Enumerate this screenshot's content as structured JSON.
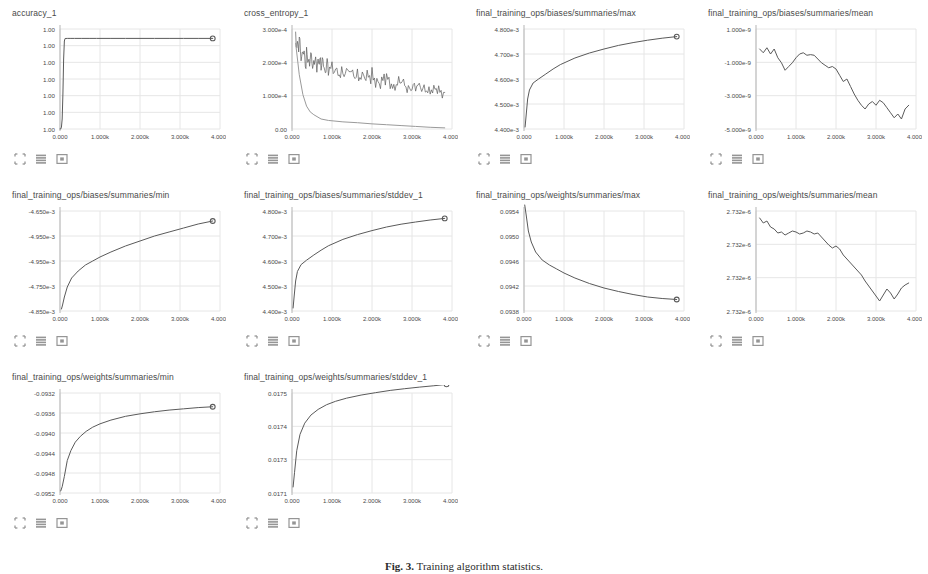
{
  "page": {
    "app": "TensorBoard Scalars Dashboard",
    "caption_label": "Fig. 3.",
    "caption_text": "Training algorithm statistics."
  },
  "toolbar": {
    "icons": [
      {
        "name": "expand-axes-icon",
        "label": "Fit domain to data"
      },
      {
        "name": "data-table-icon",
        "label": "Toggle data table"
      },
      {
        "name": "fullscreen-icon",
        "label": "Expand chart"
      }
    ]
  },
  "chart_data": [
    {
      "type": "line",
      "title": "accuracy_1",
      "xlabel": "",
      "ylabel": "",
      "grid": true,
      "legend": false,
      "xticks": [
        "0.000",
        "1.000k",
        "2.000k",
        "3.000k",
        "4.000k"
      ],
      "yticks": [
        "1.00",
        "1.00",
        "1.00",
        "1.00",
        "1.00",
        "1.00",
        "1.00"
      ],
      "xlim": [
        0,
        4400
      ],
      "ylim": [
        0,
        1
      ],
      "x": [
        0,
        20,
        40,
        60,
        80,
        100,
        120,
        140,
        200,
        300,
        400,
        600,
        800,
        1000,
        1400,
        1800,
        2200,
        2600,
        3000,
        3400,
        3800,
        4200
      ],
      "values": [
        0.0,
        0.0,
        0.02,
        0.1,
        0.35,
        0.7,
        0.88,
        0.905,
        0.906,
        0.906,
        0.906,
        0.906,
        0.906,
        0.906,
        0.906,
        0.906,
        0.906,
        0.906,
        0.906,
        0.906,
        0.906,
        0.906
      ],
      "endpoint_marker": true
    },
    {
      "type": "line",
      "title": "cross_entropy_1",
      "xlabel": "",
      "ylabel": "",
      "grid": true,
      "legend": false,
      "xticks": [
        "0.000",
        "1.000k",
        "2.000k",
        "3.000k",
        "4.000k"
      ],
      "yticks": [
        "3.000e-4",
        "2.000e-4",
        "1.000e-4",
        "0.00"
      ],
      "xlim": [
        0,
        4400
      ],
      "ylim": [
        0,
        0.00035
      ],
      "series": [
        {
          "name": "train",
          "x": [
            100,
            200,
            300,
            400,
            500,
            600,
            700,
            800,
            900,
            1000,
            1200,
            1400,
            1600,
            1800,
            2000,
            2200,
            2400,
            2600,
            2800,
            3000,
            3200,
            3400,
            3600,
            3800,
            4000,
            4200
          ],
          "values": [
            0.00033,
            0.0003,
            0.000265,
            0.000245,
            0.000235,
            0.000225,
            0.000215,
            0.000228,
            0.000205,
            0.000215,
            0.000195,
            0.000205,
            0.000188,
            0.000195,
            0.000175,
            0.000185,
            0.000162,
            0.000172,
            0.000155,
            0.000162,
            0.000145,
            0.000152,
            0.000138,
            0.000142,
            0.00013,
            0.000128
          ],
          "noisy": true
        },
        {
          "name": "test",
          "x": [
            100,
            200,
            300,
            400,
            500,
            600,
            800,
            1000,
            1400,
            1800,
            2200,
            2600,
            3000,
            3400,
            3800,
            4200
          ],
          "values": [
            0.0003,
            0.00019,
            0.00012,
            8e-05,
            6e-05,
            5e-05,
            3.5e-05,
            3e-05,
            2.5e-05,
            2.2e-05,
            1.8e-05,
            1.5e-05,
            1.2e-05,
            9e-06,
            6e-06,
            4e-06
          ],
          "noisy": false
        }
      ]
    },
    {
      "type": "line",
      "title": "final_training_ops/biases/summaries/max",
      "xlabel": "",
      "ylabel": "",
      "grid": true,
      "legend": false,
      "xticks": [
        "0.000",
        "1.000k",
        "2.000k",
        "3.000k",
        "4.000k"
      ],
      "yticks": [
        "4.800e-3",
        "4.700e-3",
        "4.600e-3",
        "4.500e-3",
        "4.400e-3"
      ],
      "xlim": [
        0,
        4400
      ],
      "ylim": [
        0.00435,
        0.00485
      ],
      "x": [
        30,
        60,
        100,
        150,
        250,
        400,
        600,
        800,
        1000,
        1400,
        1800,
        2200,
        2600,
        3000,
        3400,
        3800,
        4200
      ],
      "values": [
        0.00436,
        0.00442,
        0.0045,
        0.004545,
        0.00458,
        0.0046,
        0.004625,
        0.00465,
        0.004672,
        0.004705,
        0.00473,
        0.00475,
        0.004768,
        0.004782,
        0.004794,
        0.004804,
        0.004812
      ],
      "endpoint_marker": true
    },
    {
      "type": "line",
      "title": "final_training_ops/biases/summaries/mean",
      "xlabel": "",
      "ylabel": "",
      "grid": true,
      "legend": false,
      "xticks": [
        "0.000",
        "1.000k",
        "2.000k",
        "3.000k",
        "4.000k"
      ],
      "yticks": [
        "1.000e-9",
        "-1.000e-9",
        "-3.000e-9",
        "-5.000e-9"
      ],
      "xlim": [
        0,
        4400
      ],
      "ylim": [
        -6.2e-09,
        1.8e-09
      ],
      "x": [
        100,
        200,
        300,
        400,
        500,
        600,
        700,
        800,
        900,
        1000,
        1100,
        1200,
        1300,
        1400,
        1500,
        1600,
        1700,
        1800,
        1900,
        2000,
        2100,
        2200,
        2300,
        2400,
        2500,
        2600,
        2700,
        2800,
        2900,
        3000,
        3100,
        3200,
        3300,
        3400,
        3500,
        3600,
        3700,
        3800,
        3900,
        4000,
        4100,
        4200
      ],
      "values": [
        2e-10,
        -1e-10,
        3e-10,
        -2e-10,
        2e-10,
        -5e-10,
        -9e-10,
        -1.5e-09,
        -1.2e-09,
        -9e-10,
        -5e-10,
        -2e-10,
        -1e-10,
        -3e-10,
        -2.5e-10,
        -3e-10,
        -6e-10,
        -9e-10,
        -1.1e-09,
        -1.3e-09,
        -1.2e-09,
        -1.4e-09,
        -1.9e-09,
        -2.4e-09,
        -2.2e-09,
        -2.8e-09,
        -3.4e-09,
        -3.9e-09,
        -4.3e-09,
        -4.6e-09,
        -4.2e-09,
        -4e-09,
        -4.3e-09,
        -3.9e-09,
        -4.1e-09,
        -4.5e-09,
        -4.9e-09,
        -5.3e-09,
        -5e-09,
        -5.4e-09,
        -4.6e-09,
        -4.3e-09
      ]
    },
    {
      "type": "line",
      "title": "final_training_ops/biases/summaries/min",
      "xlabel": "",
      "ylabel": "",
      "grid": true,
      "legend": false,
      "xticks": [
        "0.000",
        "1.000k",
        "2.000k",
        "3.000k",
        "4.000k"
      ],
      "yticks": [
        "-4.650e-3",
        "-4.950e-3",
        "-4.950e-3",
        "-4.750e-3",
        "-4.850e-3"
      ],
      "xlim": [
        0,
        4400
      ],
      "ylim": [
        0,
        1
      ],
      "x": [
        40,
        70,
        120,
        200,
        320,
        500,
        700,
        900,
        1100,
        1400,
        1800,
        2200,
        2600,
        3000,
        3400,
        3800,
        4200
      ],
      "values": [
        0.02,
        0.06,
        0.14,
        0.24,
        0.33,
        0.4,
        0.46,
        0.5,
        0.54,
        0.59,
        0.65,
        0.7,
        0.75,
        0.79,
        0.83,
        0.87,
        0.9
      ],
      "endpoint_marker": true
    },
    {
      "type": "line",
      "title": "final_training_ops/biases/summaries/stddev_1",
      "xlabel": "",
      "ylabel": "",
      "grid": true,
      "legend": false,
      "xticks": [
        "0.000",
        "1.000k",
        "2.000k",
        "3.000k",
        "4.000k"
      ],
      "yticks": [
        "4.800e-3",
        "4.700e-3",
        "4.600e-3",
        "4.500e-3",
        "4.400e-3"
      ],
      "xlim": [
        0,
        4400
      ],
      "ylim": [
        0.00435,
        0.00485
      ],
      "x": [
        30,
        60,
        100,
        150,
        250,
        400,
        600,
        800,
        1000,
        1400,
        1800,
        2200,
        2600,
        3000,
        3400,
        3800,
        4200
      ],
      "values": [
        0.004365,
        0.004425,
        0.0045,
        0.004548,
        0.004582,
        0.004604,
        0.00463,
        0.004654,
        0.004676,
        0.004708,
        0.004732,
        0.004752,
        0.00477,
        0.004784,
        0.004795,
        0.004805,
        0.004813
      ],
      "endpoint_marker": true
    },
    {
      "type": "line",
      "title": "final_training_ops/weights/summaries/max",
      "xlabel": "",
      "ylabel": "",
      "grid": true,
      "legend": false,
      "xticks": [
        "0.000",
        "1.000k",
        "2.000k",
        "3.000k",
        "4.000k"
      ],
      "yticks": [
        "0.0954",
        "0.0950",
        "0.0946",
        "0.0942",
        "0.0938"
      ],
      "xlim": [
        0,
        4400
      ],
      "ylim": [
        0.0936,
        0.0956
      ],
      "x": [
        20,
        60,
        120,
        200,
        320,
        500,
        700,
        900,
        1100,
        1400,
        1800,
        2200,
        2600,
        3000,
        3400,
        3800,
        4200
      ],
      "values": [
        0.09572,
        0.09552,
        0.0952,
        0.09498,
        0.09478,
        0.09462,
        0.09452,
        0.09444,
        0.09436,
        0.09426,
        0.09415,
        0.09406,
        0.09399,
        0.09393,
        0.09388,
        0.09385,
        0.09383
      ],
      "endpoint_marker": true
    },
    {
      "type": "line",
      "title": "final_training_ops/weights/summaries/mean",
      "xlabel": "",
      "ylabel": "",
      "grid": true,
      "legend": false,
      "xticks": [
        "0.000",
        "1.000k",
        "2.000k",
        "3.000k",
        "4.000k"
      ],
      "yticks": [
        "2.732e-6",
        "2.732e-6",
        "2.732e-6",
        "2.732e-6"
      ],
      "xlim": [
        0,
        4400
      ],
      "ylim": [
        0,
        1
      ],
      "x": [
        100,
        200,
        300,
        400,
        500,
        600,
        700,
        800,
        900,
        1000,
        1100,
        1200,
        1300,
        1400,
        1500,
        1600,
        1700,
        1800,
        1900,
        2000,
        2100,
        2200,
        2300,
        2400,
        2500,
        2600,
        2700,
        2800,
        2900,
        3000,
        3100,
        3200,
        3300,
        3400,
        3500,
        3600,
        3700,
        3800,
        3900,
        4000,
        4100,
        4200
      ],
      "values": [
        0.93,
        0.88,
        0.9,
        0.84,
        0.82,
        0.78,
        0.79,
        0.76,
        0.78,
        0.8,
        0.79,
        0.77,
        0.78,
        0.8,
        0.79,
        0.77,
        0.78,
        0.74,
        0.7,
        0.66,
        0.63,
        0.65,
        0.62,
        0.56,
        0.52,
        0.48,
        0.44,
        0.4,
        0.36,
        0.3,
        0.25,
        0.2,
        0.15,
        0.1,
        0.16,
        0.22,
        0.18,
        0.12,
        0.17,
        0.23,
        0.26,
        0.28
      ]
    },
    {
      "type": "line",
      "title": "final_training_ops/weights/summaries/min",
      "xlabel": "",
      "ylabel": "",
      "grid": true,
      "legend": false,
      "xticks": [
        "0.000",
        "1.000k",
        "2.000k",
        "3.000k",
        "4.000k"
      ],
      "yticks": [
        "-0.0932",
        "-0.0936",
        "-0.0940",
        "-0.0944",
        "-0.0948",
        "-0.0952"
      ],
      "xlim": [
        0,
        4400
      ],
      "ylim": [
        -0.0954,
        -0.093
      ],
      "x": [
        20,
        60,
        120,
        200,
        300,
        420,
        560,
        720,
        900,
        1100,
        1400,
        1800,
        2200,
        2600,
        3000,
        3400,
        3800,
        4200
      ],
      "values": [
        -0.09535,
        -0.09525,
        -0.095,
        -0.09462,
        -0.09438,
        -0.09418,
        -0.09404,
        -0.09392,
        -0.09382,
        -0.09374,
        -0.09365,
        -0.09356,
        -0.0935,
        -0.09345,
        -0.09341,
        -0.09338,
        -0.09335,
        -0.09333
      ],
      "endpoint_marker": true
    },
    {
      "type": "line",
      "title": "final_training_ops/weights/summaries/stddev_1",
      "xlabel": "",
      "ylabel": "",
      "grid": true,
      "legend": false,
      "xticks": [
        "0.000",
        "1.000k",
        "2.000k",
        "3.000k",
        "4.000k"
      ],
      "yticks": [
        "0.0175",
        "0.0174",
        "0.0173",
        "0.0171"
      ],
      "xlim": [
        0,
        4400
      ],
      "ylim": [
        0.017,
        0.01758
      ],
      "x": [
        30,
        70,
        130,
        220,
        350,
        520,
        720,
        950,
        1200,
        1500,
        1900,
        2300,
        2700,
        3100,
        3500,
        3900,
        4250
      ],
      "values": [
        0.017035,
        0.01712,
        0.017245,
        0.01734,
        0.017405,
        0.017452,
        0.017485,
        0.017512,
        0.017532,
        0.01755,
        0.017568,
        0.017582,
        0.017595,
        0.017605,
        0.017614,
        0.017622,
        0.01763
      ],
      "endpoint_marker": true
    }
  ],
  "colors": {
    "line": "#5a5a5a",
    "line_secondary": "#9a9a9a",
    "grid": "#e6e6e6",
    "axis": "#b5b5b5",
    "text": "#4a4a4a"
  }
}
